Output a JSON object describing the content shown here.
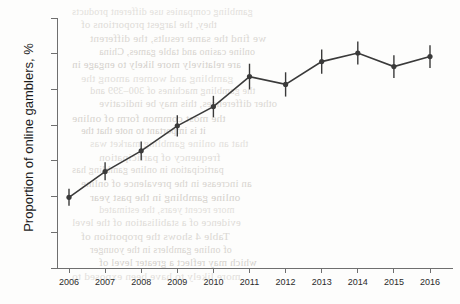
{
  "chart_data": {
    "type": "line",
    "title": "",
    "subtitle": "",
    "xlabel": "",
    "ylabel": "Proportion of online gamblers, %",
    "x": [
      2006,
      2007,
      2008,
      2009,
      2010,
      2011,
      2012,
      2013,
      2014,
      2015,
      2016
    ],
    "xtick_labels": [
      "2006",
      "2007",
      "2008",
      "2009",
      "2010",
      "2011",
      "2012",
      "2013",
      "2014",
      "2015",
      "2016"
    ],
    "ytick_labels": [
      "0",
      "5",
      "10",
      "15",
      "20",
      "25",
      "30",
      "35"
    ],
    "ytick_values": [
      0,
      5,
      10,
      15,
      20,
      25,
      30,
      35
    ],
    "ylim": [
      0,
      35
    ],
    "xlim": [
      2006,
      2016
    ],
    "grid": false,
    "legend": false,
    "marker": "filled-circle",
    "error_bars": "vertical-95-percent-confidence-interval",
    "series": [
      {
        "name": "Proportion of online gamblers",
        "values": [
          9.9,
          13.5,
          16.4,
          19.9,
          22.6,
          26.8,
          25.7,
          28.9,
          30.1,
          28.2,
          29.6
        ],
        "error_low": [
          8.7,
          12.3,
          15.1,
          18.4,
          21.1,
          25.0,
          24.0,
          27.2,
          28.5,
          26.6,
          28.0
        ],
        "error_high": [
          11.1,
          14.8,
          17.7,
          21.4,
          24.1,
          28.6,
          27.4,
          30.6,
          31.7,
          29.8,
          31.2
        ],
        "color": "#3a3a3a"
      }
    ],
    "annotations": []
  },
  "axes": {
    "y_title": "Proportion of online gamblers, %"
  },
  "background_text": {
    "lines": [
      "gambling companies use different products",
      "they, the largest proportions of",
      "we find the same results, the different",
      "online casino and table games, China",
      "are relatively more likely to engage in",
      "gambling and women among the",
      "the gambling machines of 300–399 and",
      "other differences, this may be indicative",
      "the most common form of online",
      "it is important to note that the",
      "that an online gambling market was",
      "frequency of participation",
      "participation in online gambling has",
      "an increase in the prevalence of online",
      "online gambling in the past year",
      "more recent years, the estimated",
      "evidence of a stabilisation of the level",
      "Table 4 shows the proportion of",
      "of online gamblers in the younger",
      "which may reflect a greater level of",
      "more likely to have been exposed to"
    ]
  }
}
